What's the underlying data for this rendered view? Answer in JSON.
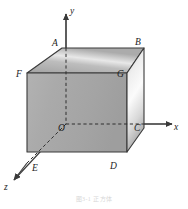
{
  "figure": {
    "caption": "图3-1  正方体",
    "background_color": "#ffffff",
    "line_color": "#3a3a3a",
    "label_color": "#1c1c1c"
  },
  "axes": [
    {
      "id": "x",
      "label": "x",
      "direction": "right",
      "label_x": 174,
      "label_y": 123
    },
    {
      "id": "y",
      "label": "y",
      "direction": "up",
      "label_x": 70,
      "label_y": 7
    },
    {
      "id": "z",
      "label": "z",
      "direction": "lower-left",
      "label_x": 4,
      "label_y": 183
    }
  ],
  "vertices": [
    {
      "id": "A",
      "label": "A",
      "x": 52,
      "y": 39,
      "role": "top-back-left"
    },
    {
      "id": "B",
      "label": "B",
      "x": 135,
      "y": 38,
      "role": "top-back-right"
    },
    {
      "id": "C",
      "label": "C",
      "x": 134,
      "y": 124,
      "role": "bottom-back-right"
    },
    {
      "id": "D",
      "label": "D",
      "x": 110,
      "y": 162,
      "role": "bottom-front-right"
    },
    {
      "id": "E",
      "label": "E",
      "x": 32,
      "y": 164,
      "role": "bottom-front-left"
    },
    {
      "id": "F",
      "label": "F",
      "x": 16,
      "y": 70,
      "role": "top-front-left"
    },
    {
      "id": "G",
      "label": "G",
      "x": 117,
      "y": 70,
      "role": "top-front-right"
    },
    {
      "id": "O",
      "label": "O",
      "x": 58,
      "y": 124,
      "role": "origin"
    }
  ],
  "faces": [
    {
      "id": "top-face",
      "fill": "top-gradient"
    },
    {
      "id": "front-face",
      "fill": "front-gradient"
    },
    {
      "id": "right-face",
      "fill": "right-gradient"
    }
  ],
  "colors": {
    "face_gray": "#a9a9a9",
    "face_gray_light": "#c9c9c9",
    "face_highlight": "#f2f2f2",
    "edge": "#3a3a3a",
    "dashed": "#2e2e2e"
  }
}
